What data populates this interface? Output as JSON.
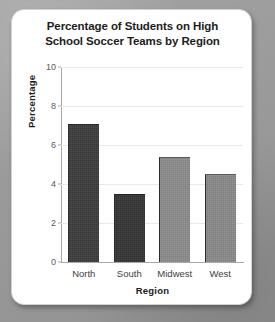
{
  "chart_data": {
    "type": "bar",
    "title": "Percentage of Students on High School Soccer Teams by Region",
    "title_line1": "Percentage of Students on High",
    "title_line2": "School Soccer Teams by Region",
    "categories": [
      "North",
      "South",
      "Midwest",
      "West"
    ],
    "values": [
      7.1,
      3.5,
      5.4,
      4.5
    ],
    "bar_colors": [
      "#3b3b3b",
      "#333333",
      "#8c8c8c",
      "#8a8a8a"
    ],
    "xlabel": "Region",
    "ylabel": "Percentage",
    "ylim": [
      0,
      10
    ],
    "yticks": [
      0,
      2,
      4,
      6,
      8,
      10
    ],
    "ytick_labels": [
      "0",
      "2",
      "4",
      "6",
      "8",
      "10"
    ],
    "grid": true,
    "grid_axis": "y",
    "legend": false,
    "legend_position": "none"
  },
  "colors": {
    "card_background": "#ffffff",
    "page_background": "#9d9d9d",
    "axis": "#a8a8a8",
    "gridline": "#e9e9e9",
    "title_text": "#1c1c1c",
    "tick_text": "#5a5a5a"
  }
}
